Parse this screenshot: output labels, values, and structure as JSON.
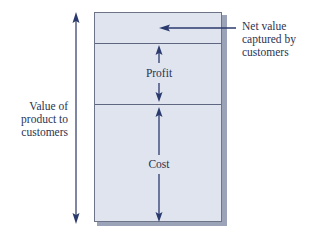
{
  "diagram": {
    "title": "",
    "colors": {
      "box_fill": "#dfe4ef",
      "box_border": "#6d7488",
      "arrow": "#2b3a6e",
      "text": "#2c3350"
    },
    "segments": [
      {
        "id": "net-value",
        "label": "Net value captured by customers",
        "label_lines": [
          "Net value",
          "captured by",
          "customers"
        ]
      },
      {
        "id": "profit",
        "label": "Profit"
      },
      {
        "id": "cost",
        "label": "Cost"
      }
    ],
    "total_label_lines": [
      "Value of",
      "product to",
      "customers"
    ],
    "total_label": "Value of product to customers"
  }
}
